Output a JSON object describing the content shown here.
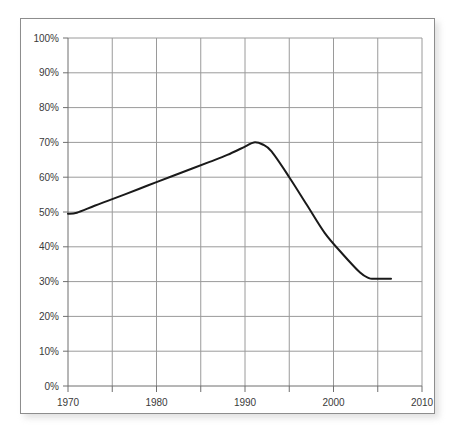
{
  "figure": {
    "frame_color": "#8d8d8d",
    "background": "#ffffff"
  },
  "chart_data": {
    "type": "line",
    "title": "",
    "subtitle": "",
    "xlabel": "",
    "ylabel": "",
    "xlim": [
      1970,
      2010
    ],
    "ylim": [
      0,
      100
    ],
    "grid": true,
    "legend": null,
    "legend_position": "none",
    "line_color": "#1a1a1a",
    "line_width_px": 2,
    "grid_color": "#9a9a9a",
    "axis_color": "#6f6f6f",
    "y_unit": "%",
    "y_ticks": [
      0,
      10,
      20,
      30,
      40,
      50,
      60,
      70,
      80,
      90,
      100
    ],
    "y_tick_labels": [
      "0%",
      "10%",
      "20%",
      "30%",
      "40%",
      "50%",
      "60%",
      "70%",
      "80%",
      "90%",
      "100%"
    ],
    "x_ticks": [
      1970,
      1975,
      1980,
      1985,
      1990,
      1995,
      2000,
      2005,
      2010
    ],
    "x_tick_labels": [
      "1970",
      "",
      "1980",
      "",
      "1990",
      "",
      "2000",
      "",
      "2010"
    ],
    "x_labeled_ticks": [
      1970,
      1980,
      1990,
      2000,
      2010
    ],
    "series": [
      {
        "name": "",
        "x": [
          1970,
          1971,
          1973,
          1975,
          1978,
          1980,
          1983,
          1986,
          1988,
          1990,
          1991,
          1992,
          1993,
          1995,
          1997,
          1999,
          2001,
          2003,
          2004,
          2004.5,
          2005,
          2006.5
        ],
        "values": [
          49.5,
          49.8,
          51.8,
          53.7,
          56.6,
          58.6,
          61.5,
          64.4,
          66.4,
          68.8,
          70.0,
          69.4,
          67.4,
          60.0,
          52.0,
          44.0,
          38.0,
          32.6,
          31.0,
          30.8,
          30.8,
          30.8
        ]
      }
    ],
    "annotations": []
  }
}
